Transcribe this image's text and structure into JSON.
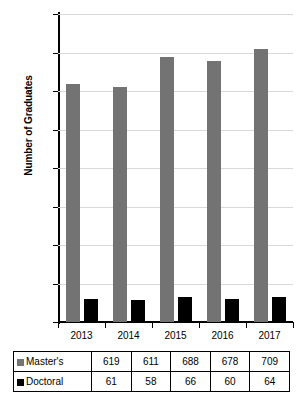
{
  "chart_data": {
    "type": "bar",
    "title": "",
    "subtitle": "",
    "xlabel": "",
    "ylabel": "Number of Graduates",
    "categories": [
      "2013",
      "2014",
      "2015",
      "2016",
      "2017"
    ],
    "series": [
      {
        "name": "Master's",
        "values": [
          619,
          611,
          688,
          678,
          709
        ],
        "color": "#737373"
      },
      {
        "name": "Doctoral",
        "values": [
          61,
          58,
          66,
          60,
          64
        ],
        "color": "#000000"
      }
    ],
    "ylim": [
      0,
      800
    ],
    "ytick_step": 100,
    "yticks": [
      "0",
      "100",
      "200",
      "300",
      "400",
      "500",
      "600",
      "700",
      "800"
    ],
    "grid": true,
    "grid_axis": "y",
    "grid_color": "#d9d9d9",
    "legend_position": "data-table-row-headers",
    "data_table": {
      "visible": true,
      "rows": [
        {
          "label": "Master's",
          "swatch": "masters",
          "cells": [
            "619",
            "611",
            "688",
            "678",
            "709"
          ]
        },
        {
          "label": "Doctoral",
          "swatch": "doctoral",
          "cells": [
            "61",
            "58",
            "66",
            "60",
            "64"
          ]
        }
      ]
    }
  }
}
